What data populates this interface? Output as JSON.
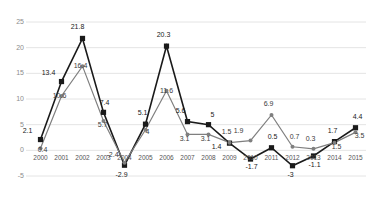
{
  "chart_data": {
    "type": "line",
    "title": "",
    "subtitle": "",
    "xlabel": "",
    "ylabel": "",
    "x": [
      2000,
      2001,
      2002,
      2003,
      2004,
      2005,
      2006,
      2007,
      2008,
      2009,
      2010,
      2011,
      2012,
      2013,
      2014,
      2015
    ],
    "categories": [
      "2000",
      "2001",
      "2002",
      "2003",
      "2004",
      "2005",
      "2006",
      "2007",
      "2008",
      "2009",
      "2010",
      "2011",
      "2012",
      "2013",
      "2014",
      "2015"
    ],
    "ylim": [
      -5,
      25
    ],
    "yticks": [
      -5,
      0,
      5,
      10,
      15,
      20,
      25
    ],
    "ytick_labels": [
      "-5",
      "0",
      "5",
      "10",
      "15",
      "20",
      "25"
    ],
    "grid": true,
    "grid_axis": "y",
    "legend": "none",
    "series": [
      {
        "name": "series-1",
        "color": "#1a1a1a",
        "marker": "square",
        "values": [
          2.1,
          13.4,
          21.8,
          7.4,
          -2.9,
          5.1,
          20.3,
          5.6,
          5.0,
          1.4,
          -1.7,
          0.5,
          -3.0,
          -1.1,
          1.7,
          4.4
        ],
        "labels": [
          "2.1",
          "13.4",
          "21.8",
          "7.4",
          "-2.9",
          "5.1",
          "20.3",
          "5.6",
          "5",
          "1.4",
          "-1.7",
          "0.5",
          "-3",
          "-1.1",
          "1.7",
          "4.4"
        ]
      },
      {
        "name": "series-2",
        "color": "#7f7f7f",
        "marker": "circle",
        "values": [
          0.4,
          10.6,
          16.4,
          5.7,
          -2.4,
          4.0,
          11.6,
          3.1,
          3.1,
          1.5,
          1.9,
          6.9,
          0.7,
          0.3,
          1.5,
          3.5
        ],
        "labels": [
          "0.4",
          "10.6",
          "16.4",
          "5.7",
          "-2.4",
          "4",
          "11.6",
          "3.1",
          "3.1",
          "1.5",
          "1.9",
          "6.9",
          "0.7",
          "0.3",
          "1.5",
          "3.5"
        ]
      }
    ]
  },
  "colors": {
    "series_1": "#1a1a1a",
    "series_2": "#7f7f7f",
    "gridline": "#e4e4e4",
    "axis_text": "#8c8c8c",
    "background": "#ffffff"
  }
}
